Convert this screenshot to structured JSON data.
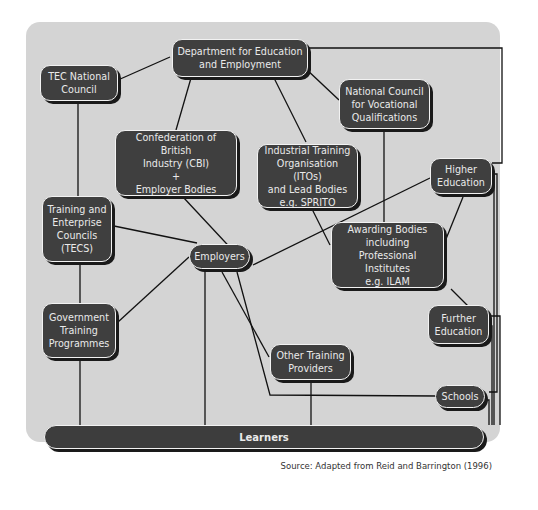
{
  "diagram": {
    "nodes": {
      "dfee": "Department for Education\nand Employment",
      "tec_national": "TEC National\nCouncil",
      "nvq": "National Council\nfor Vocational\nQualifications",
      "cbi": "Confederation of British\nIndustry (CBI)\n+\nEmployer Bodies",
      "ito": "Industrial Training\nOrganisation (ITOs)\nand Lead Bodies\ne.g. SPRITO",
      "higher_ed": "Higher\nEducation",
      "tecs": "Training and\nEnterprise\nCouncils\n(TECS)",
      "employers": "Employers",
      "awarding": "Awarding Bodies\nincluding\nProfessional Institutes\ne.g. ILAM",
      "gov_training": "Government\nTraining\nProgrammes",
      "further_ed": "Further\nEducation",
      "other_training": "Other Training\nProviders",
      "schools": "Schools",
      "learners": "Learners"
    },
    "edges": [
      [
        "dfee",
        "tec_national"
      ],
      [
        "dfee",
        "nvq"
      ],
      [
        "dfee",
        "cbi"
      ],
      [
        "dfee",
        "ito"
      ],
      [
        "dfee",
        "higher_ed"
      ],
      [
        "tec_national",
        "tecs"
      ],
      [
        "nvq",
        "awarding"
      ],
      [
        "cbi",
        "employers"
      ],
      [
        "ito",
        "awarding"
      ],
      [
        "higher_ed",
        "employers"
      ],
      [
        "higher_ed",
        "awarding"
      ],
      [
        "tecs",
        "employers"
      ],
      [
        "tecs",
        "gov_training"
      ],
      [
        "gov_training",
        "employers"
      ],
      [
        "gov_training",
        "learners"
      ],
      [
        "employers",
        "learners"
      ],
      [
        "employers",
        "other_training"
      ],
      [
        "employers",
        "schools"
      ],
      [
        "awarding",
        "further_ed"
      ],
      [
        "other_training",
        "learners"
      ],
      [
        "higher_ed",
        "learners"
      ],
      [
        "further_ed",
        "learners"
      ],
      [
        "schools",
        "learners"
      ]
    ],
    "source": "Source:  Adapted from Reid and Barrington (1996)"
  }
}
